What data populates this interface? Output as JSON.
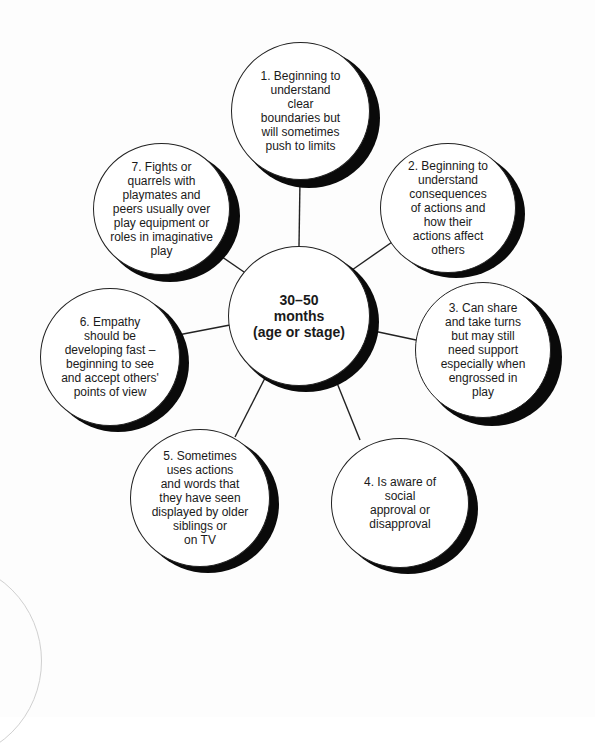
{
  "diagram": {
    "type": "spider-diagram",
    "center": {
      "label": "30–50\nmonths\n(age or stage)",
      "x": 299,
      "y": 316,
      "r": 70
    },
    "nodes": [
      {
        "id": 1,
        "label": "1. Beginning to\nunderstand\nclear\nboundaries but\nwill sometimes\npush to limits",
        "x": 300,
        "y": 111,
        "r": 69
      },
      {
        "id": 2,
        "label": "2. Beginning to\nunderstand\nconsequences\nof actions and\nhow their\nactions affect\nothers",
        "x": 448,
        "y": 208,
        "r": 68
      },
      {
        "id": 3,
        "label": "3. Can share\nand take turns\nbut may still\nneed support\nespecially when\nengrossed in\nplay",
        "x": 483,
        "y": 350,
        "r": 68
      },
      {
        "id": 4,
        "label": "4. Is aware of\nsocial\napproval or\ndisapproval",
        "x": 400,
        "y": 503,
        "r": 68
      },
      {
        "id": 5,
        "label": "5. Sometimes\nuses actions\nand words that\nthey have seen\ndisplayed by older\nsiblings or\non TV",
        "x": 200,
        "y": 498,
        "r": 69
      },
      {
        "id": 6,
        "label": "6. Empathy\nshould be\ndeveloping fast –\nbeginning to see\nand accept others'\npoints of view",
        "x": 110,
        "y": 357,
        "r": 69
      },
      {
        "id": 7,
        "label": "7. Fights or\nquarrels with\nplaymates and\npeers usually over\nplay equipment or\nroles in imaginative\nplay",
        "x": 162,
        "y": 209,
        "r": 68
      }
    ],
    "colors": {
      "outline": "#222222",
      "shadow": "#0a0a0a",
      "fill": "#ffffff",
      "text": "#1a1a1a"
    }
  }
}
